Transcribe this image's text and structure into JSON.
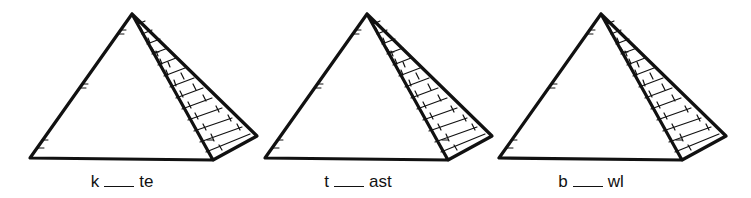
{
  "worksheet": {
    "items": [
      {
        "prefix": "k",
        "suffix": "te",
        "offset_x": 0,
        "label_center_x": 122
      },
      {
        "prefix": "t",
        "suffix": "ast",
        "offset_x": 235,
        "label_center_x": 358
      },
      {
        "prefix": "b",
        "suffix": "wl",
        "offset_x": 469,
        "label_center_x": 590
      }
    ],
    "blank_symbol": "___",
    "colors": {
      "ink": "#111111",
      "background": "#ffffff"
    }
  }
}
